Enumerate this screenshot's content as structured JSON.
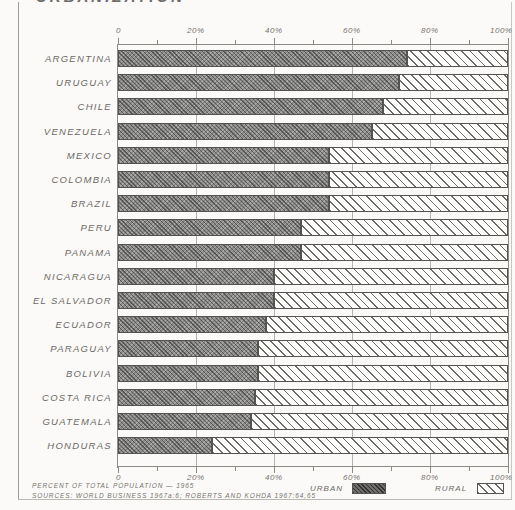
{
  "title": "URBANIZATION",
  "chart_data": {
    "type": "bar",
    "orientation": "horizontal",
    "stacked": true,
    "stack_total": 100,
    "title": "URBANIZATION",
    "xlabel": "PERCENT OF TOTAL POPULATION — 1965",
    "ylabel": "",
    "xlim": [
      0,
      100
    ],
    "grid": true,
    "legend_position": "bottom-right",
    "categories": [
      "ARGENTINA",
      "URUGUAY",
      "CHILE",
      "VENEZUELA",
      "MEXICO",
      "COLOMBIA",
      "BRAZIL",
      "PERU",
      "PANAMA",
      "NICARAGUA",
      "EL SALVADOR",
      "ECUADOR",
      "PARAGUAY",
      "BOLIVIA",
      "COSTA RICA",
      "GUATEMALA",
      "HONDURAS"
    ],
    "series": [
      {
        "name": "Urban",
        "color": "#6d6c6a",
        "pattern": "dark-crosshatch",
        "values": [
          74,
          72,
          68,
          65,
          54,
          54,
          54,
          47,
          47,
          40,
          40,
          38,
          36,
          36,
          35,
          34,
          24
        ]
      },
      {
        "name": "Rural",
        "color": "#fdfdfb",
        "pattern": "diagonal-hatch",
        "values": [
          26,
          28,
          32,
          35,
          46,
          46,
          46,
          53,
          53,
          60,
          60,
          62,
          64,
          64,
          65,
          66,
          76
        ]
      }
    ],
    "xticks_major": [
      0,
      20,
      40,
      60,
      80,
      100
    ],
    "xticklabels_major": [
      "0",
      "20%",
      "40%",
      "60%",
      "80%",
      "100%"
    ],
    "xticks_minor": [
      10,
      30,
      50,
      70,
      90
    ]
  },
  "axis": {
    "ticks": [
      {
        "value": 0,
        "label": "0"
      },
      {
        "value": 20,
        "label": "20%"
      },
      {
        "value": 40,
        "label": "40%"
      },
      {
        "value": 60,
        "label": "60%"
      },
      {
        "value": 80,
        "label": "80%"
      },
      {
        "value": 100,
        "label": "100%"
      }
    ]
  },
  "legend": {
    "urban_label": "URBAN",
    "rural_label": "RURAL"
  },
  "footer": {
    "caption": "PERCENT OF TOTAL POPULATION — 1965",
    "sources": "SOURCES:  WORLD BUSINESS 1967a:6;  ROBERTS AND KOHDA 1967:64,65"
  }
}
